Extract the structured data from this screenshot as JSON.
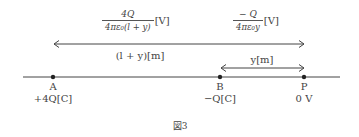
{
  "figure": {
    "caption": "図3",
    "points": [
      {
        "name": "A",
        "charge": "+4Q[C]",
        "x": 53
      },
      {
        "name": "B",
        "charge": "−Q[C]",
        "x": 220
      },
      {
        "name": "P",
        "charge": "0 V",
        "x": 304
      }
    ],
    "potentials": {
      "from_A": {
        "numerator": "4Q",
        "denominator": "4πε₀(l + y)",
        "unit": "[V]"
      },
      "from_B": {
        "numerator": "− Q",
        "denominator": "4πε₀y",
        "unit": "[V]"
      }
    },
    "distances": {
      "AP": "(l + y)[m]",
      "BP": "y[m]"
    }
  }
}
